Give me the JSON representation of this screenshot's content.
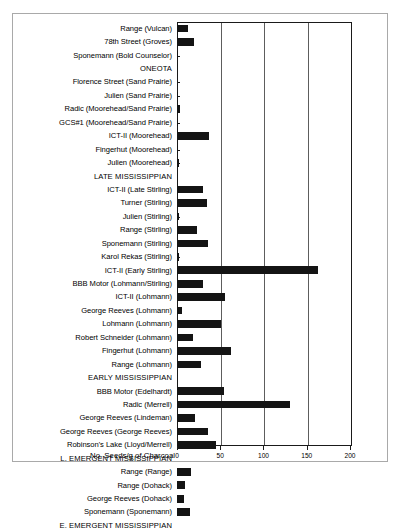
{
  "chart_data": {
    "type": "bar",
    "orientation": "horizontal",
    "title": "",
    "xlabel": "No. Seeds/g of Charcoal",
    "ylabel": "",
    "xlim": [
      0,
      200
    ],
    "xticks": [
      0,
      50,
      100,
      150,
      200
    ],
    "xtick_labels": [
      "0",
      "50",
      "100",
      "150",
      "200"
    ],
    "grid": "vertical",
    "legend": "none",
    "bar_color": "#141414",
    "categories": [
      "Range (Vulcan)",
      "78th Street (Groves)",
      "Sponemann (Bold Counselor)",
      "ONEOTA",
      "Florence Street (Sand Prairie)",
      "Julien (Sand Prairie)",
      "Radic (Moorehead/Sand Prairie)",
      "GCS#1 (Moorehead/Sand Prairie)",
      "ICT-II (Moorehead)",
      "Fingerhut (Moorehead)",
      "Julien (Moorehead)",
      "LATE MISSISSIPPIAN",
      "ICT-II (Late Stirling)",
      "Turner (Stirling)",
      "Julien (Stirling)",
      "Range (Stirling)",
      "Sponemann (Stirling)",
      "Karol Rekas (Stirling)",
      "ICT-II (Early Stirling)",
      "BBB Motor (Lohmann/Stirling)",
      "ICT-II (Lohmann)",
      "George Reeves (Lohmann)",
      "Lohmann (Lohmann)",
      "Robert Schneider (Lohmann)",
      "Fingerhut (Lohmann)",
      "Range (Lohmann)",
      "EARLY MISSISSIPPIAN",
      "BBB Motor (Edelhardt)",
      "Radic (Merrell)",
      "George Reeves (Lindeman)",
      "George Reeves (George Reeves)",
      "Robinson's Lake (Lloyd/Merrell)",
      "L. EMERGENT MISSISSIPPIAN",
      "Range (Range)",
      "Range (Dohack)",
      "George Reeves (Dohack)",
      "Sponemann (Sponemann)",
      "E. EMERGENT MISSISSIPPIAN"
    ],
    "group_rows": [
      "ONEOTA",
      "LATE MISSISSIPPIAN",
      "EARLY MISSISSIPPIAN",
      "L. EMERGENT MISSISSIPPIAN",
      "E. EMERGENT MISSISSIPPIAN"
    ],
    "values": [
      13,
      20,
      2,
      0,
      0,
      2,
      4,
      2,
      38,
      2,
      3,
      0,
      31,
      35,
      3,
      24,
      36,
      3,
      164,
      30,
      56,
      6,
      51,
      19,
      63,
      28,
      0,
      55,
      131,
      21,
      36,
      45,
      0,
      17,
      10,
      9,
      16,
      0
    ]
  }
}
